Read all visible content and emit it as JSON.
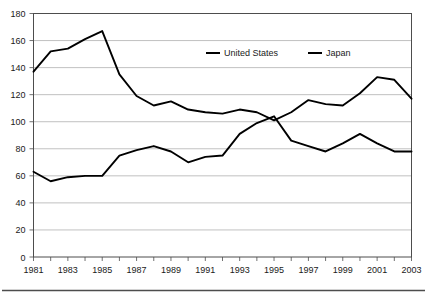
{
  "chart_data": {
    "type": "line",
    "title": "",
    "xlabel": "",
    "ylabel": "",
    "x": [
      1981,
      1982,
      1983,
      1984,
      1985,
      1986,
      1987,
      1988,
      1989,
      1990,
      1991,
      1992,
      1993,
      1994,
      1995,
      1996,
      1997,
      1998,
      1999,
      2000,
      2001,
      2002,
      2003
    ],
    "categories": [
      "1981",
      "1982",
      "1983",
      "1984",
      "1985",
      "1986",
      "1987",
      "1988",
      "1989",
      "1990",
      "1991",
      "1992",
      "1993",
      "1994",
      "1995",
      "1996",
      "1997",
      "1998",
      "1999",
      "2000",
      "2001",
      "2002",
      "2003"
    ],
    "series": [
      {
        "name": "United States",
        "color": "#000000",
        "values": [
          63,
          56,
          59,
          60,
          60,
          75,
          79,
          82,
          78,
          70,
          74,
          75,
          91,
          99,
          104,
          86,
          82,
          78,
          84,
          91,
          84,
          78,
          78
        ]
      },
      {
        "name": "Japan",
        "color": "#000000",
        "values": [
          137,
          152,
          154,
          161,
          167,
          135,
          119,
          112,
          115,
          109,
          107,
          106,
          109,
          107,
          101,
          107,
          116,
          113,
          112,
          121,
          133,
          131,
          117
        ]
      }
    ],
    "xlim": [
      1981,
      2003
    ],
    "ylim": [
      0,
      180
    ],
    "ytick_step": 20,
    "yticks": [
      "0",
      "20",
      "40",
      "60",
      "80",
      "100",
      "120",
      "140",
      "160",
      "180"
    ],
    "xticks_labeled": [
      "1981",
      "1983",
      "1985",
      "1987",
      "1989",
      "1991",
      "1993",
      "1995",
      "1997",
      "1999",
      "2001",
      "2003"
    ],
    "grid": "horizontal",
    "legend_position": "top-center-inside",
    "legend_entries": [
      "United States",
      "Japan"
    ]
  },
  "colors": {
    "line": "#000000",
    "gridline": "#a6a6a6",
    "frame": "#4d4d4d",
    "text": "#1a1a1a",
    "background": "#ffffff"
  }
}
